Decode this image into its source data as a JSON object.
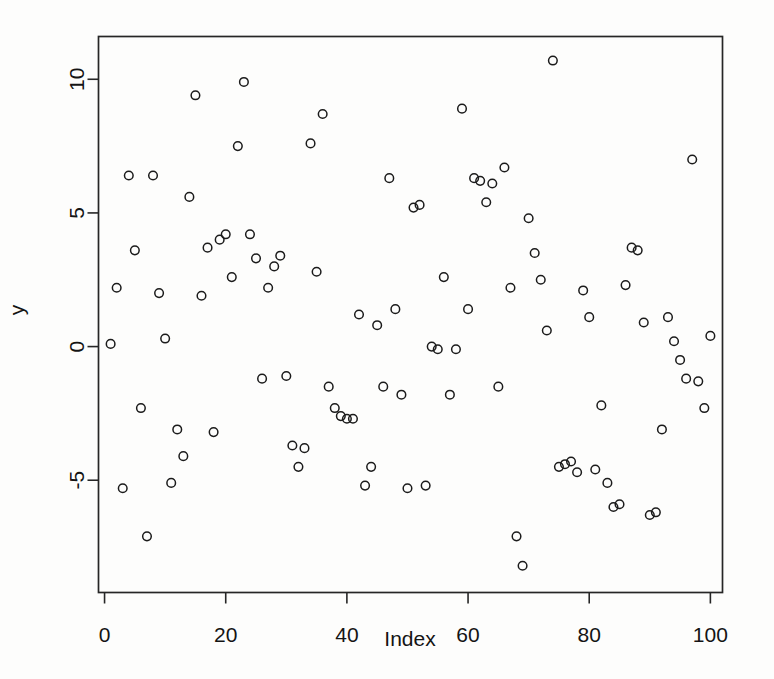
{
  "chart_data": {
    "type": "scatter",
    "title": "",
    "xlabel": "Index",
    "ylabel": "y",
    "xlim": [
      -1,
      102
    ],
    "ylim": [
      -9.2,
      11.6
    ],
    "grid": false,
    "legend": "none",
    "marker": "open-circle",
    "marker_color": "#1b1b1b",
    "xticks": [
      0,
      20,
      40,
      60,
      80,
      100
    ],
    "xticklabels": [
      "0",
      "20",
      "40",
      "60",
      "80",
      "100"
    ],
    "yticks": [
      -5,
      0,
      5,
      10
    ],
    "yticklabels": [
      "-5",
      "0",
      "5",
      "10"
    ],
    "n_points": 100,
    "x": [
      1,
      2,
      3,
      4,
      5,
      6,
      7,
      8,
      9,
      10,
      11,
      12,
      13,
      14,
      15,
      16,
      17,
      18,
      19,
      20,
      21,
      22,
      23,
      24,
      25,
      26,
      27,
      28,
      29,
      30,
      31,
      32,
      33,
      34,
      35,
      36,
      37,
      38,
      39,
      40,
      41,
      42,
      43,
      44,
      45,
      46,
      47,
      48,
      49,
      50,
      51,
      52,
      53,
      54,
      55,
      56,
      57,
      58,
      59,
      60,
      61,
      62,
      63,
      64,
      65,
      66,
      67,
      68,
      69,
      70,
      71,
      72,
      73,
      74,
      75,
      76,
      77,
      78,
      79,
      80,
      81,
      82,
      83,
      84,
      85,
      86,
      87,
      88,
      89,
      90,
      91,
      92,
      93,
      94,
      95,
      96,
      97,
      98,
      99,
      100
    ],
    "y": [
      0.1,
      2.2,
      -5.3,
      6.4,
      3.6,
      -2.3,
      -7.1,
      6.4,
      2.0,
      0.3,
      -5.1,
      -3.1,
      -4.1,
      5.6,
      9.4,
      1.9,
      3.7,
      -3.2,
      4.0,
      4.2,
      2.6,
      7.5,
      9.9,
      4.2,
      3.3,
      -1.2,
      2.2,
      3.0,
      3.4,
      -1.1,
      -3.7,
      -4.5,
      -3.8,
      7.6,
      2.8,
      8.7,
      -1.5,
      -2.3,
      -2.6,
      -2.7,
      -2.7,
      1.2,
      -5.2,
      -4.5,
      0.8,
      -1.5,
      6.3,
      1.4,
      -1.8,
      -5.3,
      5.2,
      5.3,
      -5.2,
      0.0,
      -0.1,
      2.6,
      -1.8,
      -0.1,
      8.9,
      1.4,
      6.3,
      6.2,
      5.4,
      6.1,
      -1.5,
      6.7,
      2.2,
      -7.1,
      -8.2,
      4.8,
      3.5,
      2.5,
      0.6,
      10.7,
      -4.5,
      -4.4,
      -4.3,
      -4.7,
      2.1,
      1.1,
      -4.6,
      -2.2,
      -5.1,
      -6.0,
      -5.9,
      2.3,
      3.7,
      3.6,
      0.9,
      -6.3,
      -6.2,
      -3.1,
      1.1,
      0.2,
      -0.5,
      -1.2,
      7.0,
      -1.3,
      -2.3,
      0.4
    ]
  },
  "axes": {
    "y_axis_title": "y",
    "x_axis_title": "Index"
  }
}
